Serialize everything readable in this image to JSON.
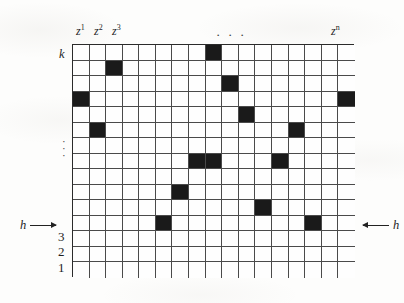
{
  "figure": {
    "kind": "lattice-grid-diagram",
    "background_color": "#fdfdfc",
    "ink_color": "#1a1a1a",
    "grid": {
      "columns": 17,
      "rows": 15,
      "cell_width_px": 16.59,
      "cell_height_px": 15.53,
      "border_color": "#2b2b2b",
      "line_color": "#4a4a4a",
      "cell_fill_color": "#1a1a1a",
      "empty_fill_color": "#fefefe"
    },
    "column_labels": [
      {
        "text": "z",
        "sup": "1",
        "col": 1
      },
      {
        "text": "z",
        "sup": "2",
        "col": 2
      },
      {
        "text": "z",
        "sup": "3",
        "col": 3
      },
      {
        "text": "z",
        "sup": "n",
        "col": 17
      }
    ],
    "column_ellipsis": "· · ·",
    "row_labels_top": [
      {
        "text": "k",
        "row": 1
      }
    ],
    "row_labels_bottom": [
      {
        "text": "3",
        "row": 13
      },
      {
        "text": "2",
        "row": 14
      },
      {
        "text": "1",
        "row": 15
      }
    ],
    "row_ellipsis": "·",
    "left_annotation": {
      "label": "h",
      "arrow": "right-arrow-icon"
    },
    "right_annotation": {
      "label": "h",
      "arrow": "left-arrow-icon"
    },
    "filled_cells": [
      {
        "row": 1,
        "col": 9
      },
      {
        "row": 2,
        "col": 3
      },
      {
        "row": 3,
        "col": 10
      },
      {
        "row": 4,
        "col": 1
      },
      {
        "row": 4,
        "col": 17
      },
      {
        "row": 5,
        "col": 11
      },
      {
        "row": 6,
        "col": 2
      },
      {
        "row": 6,
        "col": 14
      },
      {
        "row": 8,
        "col": 8
      },
      {
        "row": 8,
        "col": 9
      },
      {
        "row": 8,
        "col": 13
      },
      {
        "row": 10,
        "col": 7
      },
      {
        "row": 11,
        "col": 12
      },
      {
        "row": 12,
        "col": 6
      },
      {
        "row": 12,
        "col": 15
      }
    ]
  }
}
